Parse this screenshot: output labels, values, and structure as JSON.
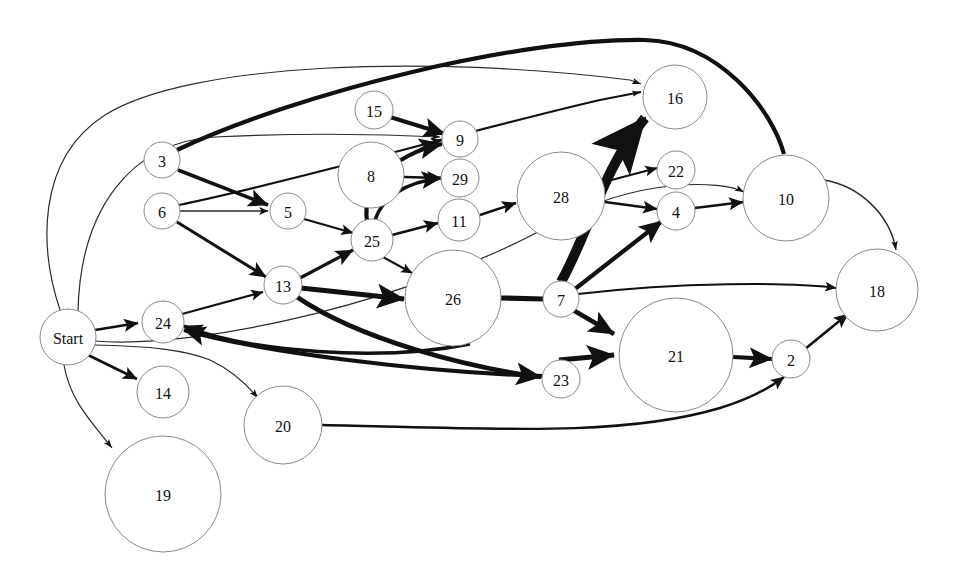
{
  "diagram": {
    "type": "directed-graph",
    "title": "",
    "background": "#ffffff",
    "node_fill": "#ffffff",
    "node_stroke": "#8a8a8a",
    "edge_color": "#111111",
    "nodes": [
      {
        "id": "Start",
        "label": "Start",
        "cx": 68,
        "cy": 337,
        "r": 28,
        "font": 16
      },
      {
        "id": "3",
        "label": "3",
        "cx": 162,
        "cy": 160,
        "r": 18,
        "font": 16
      },
      {
        "id": "6",
        "label": "6",
        "cx": 162,
        "cy": 211,
        "r": 18,
        "font": 16
      },
      {
        "id": "5",
        "label": "5",
        "cx": 288,
        "cy": 211,
        "r": 18,
        "font": 16
      },
      {
        "id": "13",
        "label": "13",
        "cx": 283,
        "cy": 285,
        "r": 19,
        "font": 16
      },
      {
        "id": "24",
        "label": "24",
        "cx": 163,
        "cy": 322,
        "r": 21,
        "font": 16
      },
      {
        "id": "14",
        "label": "14",
        "cx": 163,
        "cy": 392,
        "r": 26,
        "font": 16
      },
      {
        "id": "19",
        "label": "19",
        "cx": 163,
        "cy": 494,
        "r": 58,
        "font": 16
      },
      {
        "id": "20",
        "label": "20",
        "cx": 283,
        "cy": 425,
        "r": 39,
        "font": 16
      },
      {
        "id": "25",
        "label": "25",
        "cx": 372,
        "cy": 240,
        "r": 21,
        "font": 16
      },
      {
        "id": "8",
        "label": "8",
        "cx": 371,
        "cy": 175,
        "r": 33,
        "font": 16
      },
      {
        "id": "15",
        "label": "15",
        "cx": 374,
        "cy": 110,
        "r": 19,
        "font": 16
      },
      {
        "id": "9",
        "label": "9",
        "cx": 460,
        "cy": 139,
        "r": 18,
        "font": 16
      },
      {
        "id": "29",
        "label": "29",
        "cx": 460,
        "cy": 178,
        "r": 19,
        "font": 16
      },
      {
        "id": "11",
        "label": "11",
        "cx": 459,
        "cy": 220,
        "r": 21,
        "font": 16
      },
      {
        "id": "26",
        "label": "26",
        "cx": 453,
        "cy": 298,
        "r": 48,
        "font": 16
      },
      {
        "id": "23",
        "label": "23",
        "cx": 561,
        "cy": 379,
        "r": 19,
        "font": 16
      },
      {
        "id": "28",
        "label": "28",
        "cx": 561,
        "cy": 196,
        "r": 44,
        "font": 16
      },
      {
        "id": "7",
        "label": "7",
        "cx": 561,
        "cy": 299,
        "r": 18,
        "font": 16
      },
      {
        "id": "16",
        "label": "16",
        "cx": 675,
        "cy": 97,
        "r": 32,
        "font": 16
      },
      {
        "id": "22",
        "label": "22",
        "cx": 676,
        "cy": 170,
        "r": 19,
        "font": 16
      },
      {
        "id": "4",
        "label": "4",
        "cx": 676,
        "cy": 211,
        "r": 19,
        "font": 16
      },
      {
        "id": "21",
        "label": "21",
        "cx": 676,
        "cy": 355,
        "r": 57,
        "font": 16
      },
      {
        "id": "10",
        "label": "10",
        "cx": 786,
        "cy": 198,
        "r": 43,
        "font": 16
      },
      {
        "id": "2",
        "label": "2",
        "cx": 791,
        "cy": 359,
        "r": 19,
        "font": 16
      },
      {
        "id": "18",
        "label": "18",
        "cx": 877,
        "cy": 290,
        "r": 41,
        "font": 16
      }
    ],
    "edges": [
      {
        "from": "Start",
        "to": "16",
        "width": 1.2,
        "arrow": "thin",
        "path": "M 60 310 C 40 250 35 160 105 115 C 190 62 430 55 630 80 L 641 84"
      },
      {
        "from": "Start",
        "to": "9",
        "width": 1.2,
        "arrow": "thin",
        "path": "M 78 312 C 80 210 130 142 215 137 C 300 133 380 134 440 137"
      },
      {
        "from": "Start",
        "to": "24",
        "width": 2.6,
        "arrow": "solid",
        "path": "M 95 330 L 138 323"
      },
      {
        "from": "Start",
        "to": "10",
        "width": 1.2,
        "arrow": "thin",
        "path": "M 94 341 C 200 350 420 300 560 220 C 640 178 720 180 744 192"
      },
      {
        "from": "Start",
        "to": "14",
        "width": 2.6,
        "arrow": "solid",
        "path": "M 88 355 L 137 379"
      },
      {
        "from": "Start",
        "to": "19",
        "width": 1.2,
        "arrow": "thin",
        "path": "M 64 365 C 70 400 90 420 112 448"
      },
      {
        "from": "3",
        "to": "10",
        "width": 4.2,
        "arrow": "none",
        "path": "M 177 150 C 300 92 520 38 645 40 C 720 42 772 110 784 154"
      },
      {
        "from": "3",
        "to": "5",
        "width": 3.6,
        "arrow": "solid",
        "path": "M 178 170 L 268 205"
      },
      {
        "from": "6",
        "to": "5",
        "width": 1.6,
        "arrow": "solid",
        "path": "M 180 211 L 268 211"
      },
      {
        "from": "6",
        "to": "13",
        "width": 3.0,
        "arrow": "solid",
        "path": "M 177 222 L 266 277"
      },
      {
        "from": "6",
        "to": "16",
        "width": 2.2,
        "arrow": "thin",
        "path": "M 179 205 C 300 180 470 130 600 100 L 641 92"
      },
      {
        "from": "24",
        "to": "13",
        "width": 2.2,
        "arrow": "solid",
        "path": "M 182 314 L 263 292"
      },
      {
        "from": "5",
        "to": "25",
        "width": 2.2,
        "arrow": "solid",
        "path": "M 304 219 L 353 233"
      },
      {
        "from": "13",
        "to": "25",
        "width": 3.2,
        "arrow": "solid",
        "path": "M 300 278 L 353 250"
      },
      {
        "from": "13",
        "to": "26",
        "width": 5.0,
        "arrow": "solid",
        "path": "M 301 288 L 404 299"
      },
      {
        "from": "13",
        "to": "23",
        "width": 4.6,
        "arrow": "solid",
        "path": "M 297 297 C 360 340 470 368 541 377"
      },
      {
        "from": "25",
        "to": "9",
        "width": 4.2,
        "arrow": "solid",
        "path": "M 367 221 C 362 190 390 155 442 144"
      },
      {
        "from": "25",
        "to": "29",
        "width": 3.6,
        "arrow": "solid",
        "path": "M 375 220 C 382 198 405 182 441 178"
      },
      {
        "from": "25",
        "to": "11",
        "width": 2.6,
        "arrow": "solid",
        "path": "M 392 235 L 438 223"
      },
      {
        "from": "25",
        "to": "26",
        "width": 2.0,
        "arrow": "solid",
        "path": "M 383 257 L 412 273"
      },
      {
        "from": "8",
        "to": "9",
        "width": 2.0,
        "arrow": "solid",
        "path": "M 401 160 C 418 150 430 143 442 140"
      },
      {
        "from": "8",
        "to": "29",
        "width": 2.6,
        "arrow": "solid",
        "path": "M 404 177 L 441 178"
      },
      {
        "from": "15",
        "to": "9",
        "width": 4.0,
        "arrow": "solid",
        "path": "M 390 117 L 445 134"
      },
      {
        "from": "11",
        "to": "28",
        "width": 2.6,
        "arrow": "solid",
        "path": "M 480 215 L 516 203"
      },
      {
        "from": "26",
        "to": "7",
        "width": 5.2,
        "arrow": "none",
        "path": "M 501 298 L 543 299"
      },
      {
        "from": "7",
        "to": "16",
        "width": 10.0,
        "arrow": "solid",
        "path": "M 561 282 C 590 230 602 170 645 118"
      },
      {
        "from": "7",
        "to": "21",
        "width": 4.6,
        "arrow": "solid",
        "path": "M 573 310 L 614 334"
      },
      {
        "from": "7",
        "to": "18",
        "width": 2.0,
        "arrow": "solid",
        "path": "M 578 294 C 680 282 790 282 836 288"
      },
      {
        "from": "23",
        "to": "21",
        "width": 5.0,
        "arrow": "solid",
        "path": "M 559 360 L 614 355"
      },
      {
        "from": "23",
        "to": "24",
        "width": 4.0,
        "arrow": "solid",
        "path": "M 543 376 C 420 372 260 352 184 330"
      },
      {
        "from": "26",
        "to": "24",
        "width": 3.4,
        "arrow": "solid",
        "path": "M 470 344 C 380 362 250 352 184 326"
      },
      {
        "from": "28",
        "to": "22",
        "width": 2.2,
        "arrow": "solid",
        "path": "M 604 182 L 657 168"
      },
      {
        "from": "28",
        "to": "4",
        "width": 2.6,
        "arrow": "solid",
        "path": "M 605 202 L 657 209"
      },
      {
        "from": "7",
        "to": "4",
        "width": 4.2,
        "arrow": "solid",
        "path": "M 575 289 L 662 221"
      },
      {
        "from": "4",
        "to": "10",
        "width": 2.6,
        "arrow": "solid",
        "path": "M 695 208 L 743 202"
      },
      {
        "from": "10",
        "to": "18",
        "width": 1.4,
        "arrow": "thin",
        "path": "M 824 180 C 860 186 890 215 896 250"
      },
      {
        "from": "21",
        "to": "2",
        "width": 4.2,
        "arrow": "solid",
        "path": "M 733 357 L 772 359"
      },
      {
        "from": "2",
        "to": "18",
        "width": 2.6,
        "arrow": "solid",
        "path": "M 805 349 L 848 314"
      },
      {
        "from": "20",
        "to": "2",
        "width": 2.4,
        "arrow": "solid",
        "path": "M 322 425 C 480 428 620 438 720 408 C 760 396 780 380 784 377"
      },
      {
        "from": "Start",
        "to": "20",
        "width": 1.2,
        "arrow": "thin",
        "path": "M 93 345 C 150 346 185 350 210 360 C 232 370 248 386 258 398"
      }
    ]
  }
}
